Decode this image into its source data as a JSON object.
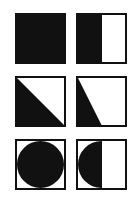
{
  "figure": {
    "layout": {
      "rows": 3,
      "cols": 2
    },
    "colors": {
      "fill": "#111111",
      "background": "#ffffff",
      "border": "#111111"
    },
    "tiles": [
      {
        "id": "full-square",
        "shape": "square",
        "fill": "full",
        "x": 15,
        "y": 13
      },
      {
        "id": "half-square",
        "shape": "square",
        "fill": "left-half",
        "x": 76,
        "y": 13
      },
      {
        "id": "full-diagonal-triangle",
        "shape": "triangle",
        "fill": "lower-left-diagonal",
        "x": 15,
        "y": 76
      },
      {
        "id": "half-triangle",
        "shape": "triangle",
        "fill": "left-to-half-bottom",
        "x": 76,
        "y": 76
      },
      {
        "id": "full-circle",
        "shape": "circle",
        "fill": "full",
        "x": 15,
        "y": 139
      },
      {
        "id": "half-circle",
        "shape": "circle",
        "fill": "left-half",
        "x": 76,
        "y": 139
      }
    ]
  }
}
